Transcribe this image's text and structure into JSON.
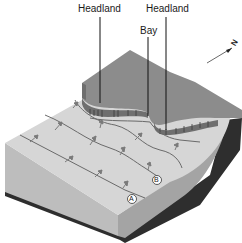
{
  "diagram": {
    "labels": {
      "headland_left": "Headland",
      "headland_right": "Headland",
      "bay": "Bay"
    },
    "points": {
      "a": "A",
      "b": "B"
    },
    "north_arrow": {
      "label": "N",
      "icon": "north-arrow-icon"
    },
    "colors": {
      "land_top": "#8c8c8c",
      "sea_floor_top": "#d4d4d4",
      "front_face": "#b9b9b9",
      "side_face": "#9a9a9a",
      "base_layer": "#2e2e2e",
      "cliff_face": "#6f6f6f",
      "wave_line": "#6a6a6a",
      "leader_line": "#111111"
    }
  }
}
